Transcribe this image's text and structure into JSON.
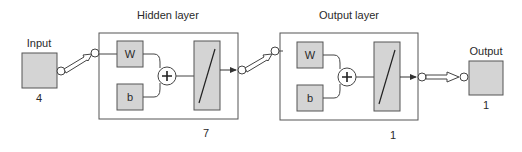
{
  "diagram": {
    "type": "neural-network-architecture",
    "colors": {
      "block_fill": "#d4d4d4",
      "stroke": "#444444",
      "background": "#ffffff"
    },
    "input": {
      "label": "Input",
      "size": "4"
    },
    "hidden_layer": {
      "title": "Hidden layer",
      "weight_label": "W",
      "bias_label": "b",
      "sum_symbol": "+",
      "transfer": "linear-transfer-icon",
      "size": "7"
    },
    "output_layer": {
      "title": "Output layer",
      "weight_label": "W",
      "bias_label": "b",
      "sum_symbol": "+",
      "transfer": "linear-transfer-icon",
      "size": "1"
    },
    "output": {
      "label": "Output",
      "size": "1"
    }
  }
}
